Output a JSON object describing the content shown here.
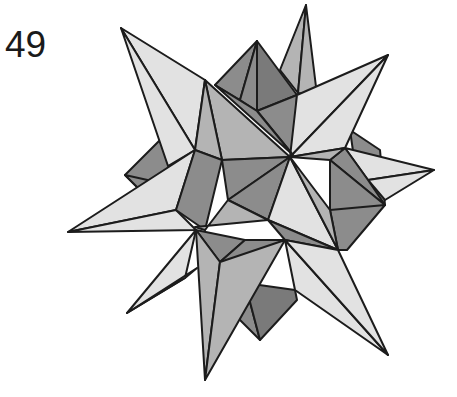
{
  "figure": {
    "number_label": "49",
    "colors": {
      "light_face": "#e2e2e2",
      "medium_face": "#b4b4b4",
      "dark_face": "#8c8c8c",
      "edge": "#1c1c1c",
      "background": "#ffffff"
    }
  }
}
